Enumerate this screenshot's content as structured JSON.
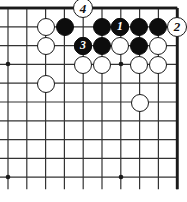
{
  "diagram": {
    "kind": "go-board-problem-diagram",
    "board": {
      "cols": 10,
      "rows": 10,
      "origin_x": 8,
      "origin_y": 8,
      "spacing": 18.8,
      "line_color": "#333333",
      "edge_color": "#1a1a1a",
      "background": "#ffffff",
      "stone_radius": 9.4,
      "star_points": [
        {
          "x": 8,
          "y": 64,
          "name": "star-point-left-upper"
        },
        {
          "x": 8,
          "y": 177,
          "name": "star-point-left-lower"
        },
        {
          "x": 121,
          "y": 64,
          "name": "star-point-center"
        },
        {
          "x": 121,
          "y": 177,
          "name": "star-point-bottom"
        }
      ]
    },
    "stones": [
      {
        "id": "w-r1-c2",
        "color": "white",
        "x": 46,
        "y": 27
      },
      {
        "id": "b-r1-c3",
        "color": "black",
        "x": 65,
        "y": 27
      },
      {
        "id": "b-r1-c5",
        "color": "black",
        "x": 102,
        "y": 27
      },
      {
        "id": "b-r1-c6",
        "color": "black",
        "x": 120,
        "y": 27,
        "label": "1"
      },
      {
        "id": "b-r1-c7",
        "color": "black",
        "x": 139,
        "y": 27
      },
      {
        "id": "b-r1-c8",
        "color": "black",
        "x": 158,
        "y": 27
      },
      {
        "id": "w-r2-c2",
        "color": "white",
        "x": 46,
        "y": 46
      },
      {
        "id": "b-r2-c4",
        "color": "black",
        "x": 83,
        "y": 46,
        "label": "3"
      },
      {
        "id": "b-r2-c5",
        "color": "black",
        "x": 102,
        "y": 46
      },
      {
        "id": "w-r2-c6",
        "color": "white",
        "x": 120,
        "y": 46
      },
      {
        "id": "b-r2-c7",
        "color": "black",
        "x": 139,
        "y": 46
      },
      {
        "id": "w-r2-c8",
        "color": "white",
        "x": 158,
        "y": 46
      },
      {
        "id": "w-r3-c4",
        "color": "white",
        "x": 83,
        "y": 65
      },
      {
        "id": "w-r3-c5",
        "color": "white",
        "x": 102,
        "y": 65
      },
      {
        "id": "w-r3-c7",
        "color": "white",
        "x": 139,
        "y": 65
      },
      {
        "id": "w-r3-c8",
        "color": "white",
        "x": 158,
        "y": 65
      },
      {
        "id": "w-r4-c2",
        "color": "white",
        "x": 46,
        "y": 84
      },
      {
        "id": "w-r5-c7",
        "color": "white",
        "x": 140,
        "y": 103
      }
    ],
    "move_markers": [
      {
        "id": "move-1",
        "label": "1",
        "style": "on-black",
        "x": 120,
        "y": 27,
        "radius": 9.4,
        "note": "black stone numbered 1"
      },
      {
        "id": "move-3",
        "label": "3",
        "style": "on-black",
        "x": 83,
        "y": 46,
        "radius": 9.4,
        "note": "black stone numbered 3"
      },
      {
        "id": "move-4",
        "label": "4",
        "style": "off-board",
        "x": 83,
        "y": 8,
        "radius": 10.4,
        "note": "white move 4 shown above top edge"
      },
      {
        "id": "move-2",
        "label": "2",
        "style": "off-board",
        "x": 177,
        "y": 27,
        "radius": 10.4,
        "note": "white move 2 shown right of board edge"
      }
    ]
  }
}
